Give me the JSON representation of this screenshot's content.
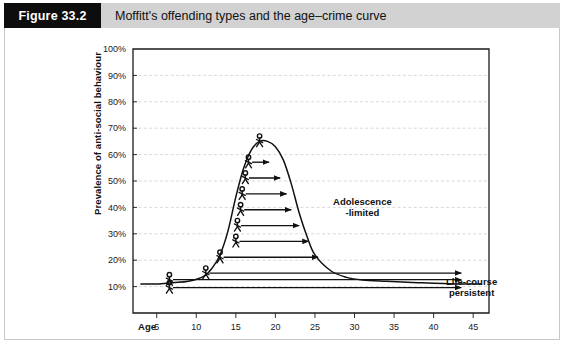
{
  "caption": {
    "tag": "Figure 33.2",
    "text": "Moffitt's offending types and the age–crime curve"
  },
  "axes": {
    "y_title": "Prevalence of anti-social behaviour",
    "y_ticks": [
      "100%",
      "90%",
      "80%",
      "70%",
      "60%",
      "50%",
      "40%",
      "30%",
      "20%",
      "10%"
    ],
    "y_values": [
      100,
      90,
      80,
      70,
      60,
      50,
      40,
      30,
      20,
      10
    ],
    "x_axis_name": "Age",
    "x_ticks": [
      "5",
      "10",
      "15",
      "20",
      "25",
      "30",
      "35",
      "40",
      "45"
    ],
    "x_values": [
      5,
      10,
      15,
      20,
      25,
      30,
      35,
      40,
      45
    ]
  },
  "annotations": {
    "adolescence_line1": "Adolescence",
    "adolescence_line2": "-limited",
    "lifecourse_line1": "Life-course",
    "lifecourse_line2": "persistent"
  },
  "colors": {
    "tag_background": "#0d0d0d",
    "tag_text": "#ffffff",
    "caption_background": "#d2d2d2",
    "panel_background": "#ffffff",
    "panel_border": "#c8c8c8",
    "gridline": "#c9c9c9",
    "axis": "#1a1a1a",
    "curve": "#111111",
    "figure_stroke": "#111111",
    "arrow": "#111111"
  },
  "chart_data": {
    "type": "line",
    "title": "Moffitt's offending types and the age–crime curve",
    "xlabel": "Age",
    "ylabel": "Prevalence of anti-social behaviour",
    "xlim": [
      2,
      47
    ],
    "ylim": [
      0,
      100
    ],
    "grid": true,
    "legend": "none",
    "series": [
      {
        "name": "age-crime curve",
        "comment": "bell shaped prevalence curve peaking in late adolescence",
        "x": [
          3,
          5,
          7,
          9,
          11,
          12,
          13,
          14,
          15,
          16,
          17,
          18,
          19,
          20,
          21,
          22,
          23,
          24,
          25,
          27,
          29,
          31,
          34,
          38,
          43,
          46
        ],
        "y": [
          11,
          11,
          11.5,
          12,
          14,
          17,
          22,
          31,
          44,
          55,
          62,
          65,
          65,
          63,
          58,
          49,
          38,
          29,
          22,
          16,
          13.5,
          12.5,
          12,
          11.5,
          11,
          11
        ]
      }
    ],
    "offenders": [
      {
        "id": 1,
        "age": 18.0,
        "prevalence": 63,
        "arrow": false,
        "arrow_to_age": null
      },
      {
        "id": 2,
        "age": 16.6,
        "prevalence": 55,
        "arrow": true,
        "arrow_to_age": 19.2
      },
      {
        "id": 3,
        "age": 16.2,
        "prevalence": 49,
        "arrow": true,
        "arrow_to_age": 20.6
      },
      {
        "id": 4,
        "age": 15.8,
        "prevalence": 43,
        "arrow": true,
        "arrow_to_age": 21.4
      },
      {
        "id": 5,
        "age": 15.6,
        "prevalence": 37,
        "arrow": true,
        "arrow_to_age": 22.0
      },
      {
        "id": 6,
        "age": 15.2,
        "prevalence": 31,
        "arrow": true,
        "arrow_to_age": 23.0
      },
      {
        "id": 7,
        "age": 15.0,
        "prevalence": 25,
        "arrow": true,
        "arrow_to_age": 24.2
      },
      {
        "id": 8,
        "age": 13.0,
        "prevalence": 19,
        "arrow": true,
        "arrow_to_age": 25.4
      },
      {
        "id": 9,
        "age": 11.2,
        "prevalence": 13,
        "arrow": true,
        "arrow_to_age": 43.5
      },
      {
        "id": 10,
        "age": 6.6,
        "prevalence": 10.5,
        "arrow": true,
        "arrow_to_age": 43.5
      },
      {
        "id": 11,
        "age": 6.6,
        "prevalence": 7.5,
        "arrow": true,
        "arrow_to_age": 43.5
      }
    ],
    "annotations": [
      {
        "text": "Adolescence -limited",
        "age": 31,
        "prevalence": 41
      },
      {
        "text": "Life-course persistent",
        "age": 44.5,
        "prevalence": 9.5
      }
    ]
  }
}
